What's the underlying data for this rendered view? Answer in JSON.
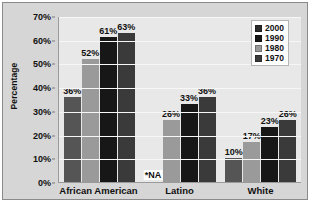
{
  "chart_data": {
    "type": "bar",
    "title": "",
    "xlabel": "",
    "ylabel": "Percentage",
    "ylim": [
      0,
      70
    ],
    "ytick_labels": [
      "70%",
      "60%",
      "50%",
      "40%",
      "30%",
      "20%",
      "10%",
      "0%"
    ],
    "ytick_values": [
      70,
      60,
      50,
      40,
      30,
      20,
      10,
      0
    ],
    "grid": true,
    "legend_position": "top-right",
    "categories": [
      "African American",
      "Latino",
      "White"
    ],
    "series": [
      {
        "name": "2000",
        "color": "#555555",
        "values": [
          36,
          null,
          10
        ],
        "labels": [
          "36%",
          "*NA",
          "10%"
        ]
      },
      {
        "name": "1990",
        "color": "#9a9a9a",
        "values": [
          52,
          26,
          17
        ],
        "labels": [
          "52%",
          "26%",
          "17%"
        ]
      },
      {
        "name": "1980",
        "color": "#171717",
        "values": [
          61,
          33,
          23
        ],
        "labels": [
          "61%",
          "33%",
          "23%"
        ]
      },
      {
        "name": "1970",
        "color": "#3a3a3a",
        "values": [
          63,
          36,
          26
        ],
        "labels": [
          "63%",
          "36%",
          "26%"
        ]
      }
    ],
    "annotations": [
      {
        "text": "*NA",
        "category": "Latino",
        "series": "2000"
      }
    ]
  },
  "legend": {
    "entries": [
      {
        "label": "2000",
        "color": "#2b2b2b"
      },
      {
        "label": "1990",
        "color": "#171717"
      },
      {
        "label": "1980",
        "color": "#9a9a9a"
      },
      {
        "label": "1970",
        "color": "#3a3a3a"
      }
    ]
  },
  "colors": {
    "panel_background": "#d6d6d6",
    "plot_background": "#e8e8e8",
    "gridline": "#f7f7f7",
    "axis": "#9a9a9a",
    "text": "#111111"
  }
}
